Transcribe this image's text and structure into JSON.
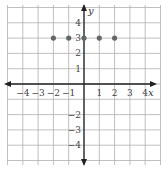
{
  "chart_data": {
    "type": "scatter",
    "title": "",
    "xlabel": "x",
    "ylabel": "y",
    "xlim": [
      -5,
      5
    ],
    "ylim": [
      -5,
      5
    ],
    "grid": true,
    "x_ticks": [
      "−4",
      "−3",
      "−2",
      "−1",
      "1",
      "2",
      "3",
      "4"
    ],
    "y_ticks": [
      "4",
      "3",
      "2",
      "1",
      "−2",
      "−3",
      "−4"
    ],
    "points": [
      {
        "x": -2,
        "y": 3
      },
      {
        "x": -1,
        "y": 3
      },
      {
        "x": 0,
        "y": 3
      },
      {
        "x": 1,
        "y": 3
      },
      {
        "x": 2,
        "y": 3
      }
    ],
    "colors": {
      "grid": "#b0b0b0",
      "axis": "#222222",
      "point": "#666666"
    }
  }
}
